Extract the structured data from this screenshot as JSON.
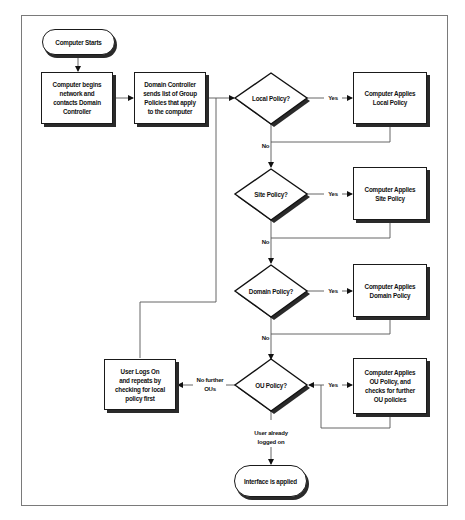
{
  "diagram": {
    "type": "flowchart",
    "nodes": {
      "start": "Computer Starts",
      "begin_network": [
        "Computer begins",
        "network and",
        "contacts Domain",
        "Controller"
      ],
      "dc_sends": [
        "Domain Controller",
        "sends list of Group",
        "Policies that apply",
        "to the computer"
      ],
      "local_q": "Local Policy?",
      "local_apply": [
        "Computer Applies",
        "Local Policy"
      ],
      "site_q": "Site Policy?",
      "site_apply": [
        "Computer Applies",
        "Site Policy"
      ],
      "domain_q": "Domain Policy?",
      "domain_apply": [
        "Computer Applies",
        "Domain Policy"
      ],
      "ou_q": "OU Policy?",
      "ou_apply": [
        "Computer Applies",
        "OU Policy, and",
        "checks for further",
        "OU policies"
      ],
      "user_logs_on": [
        "User Logs On",
        "and repeats by",
        "checking for local",
        "policy first"
      ],
      "end": "Interface is applied"
    },
    "edge_labels": {
      "yes": "Yes",
      "no": "No",
      "no_further": [
        "No further",
        "OUs"
      ],
      "user_logged_on": [
        "User already",
        "logged on"
      ]
    },
    "edges": [
      {
        "from": "start",
        "to": "begin_network"
      },
      {
        "from": "begin_network",
        "to": "dc_sends"
      },
      {
        "from": "dc_sends",
        "to": "local_q"
      },
      {
        "from": "local_q",
        "to": "local_apply",
        "label": "Yes"
      },
      {
        "from": "local_q",
        "to": "site_q",
        "label": "No"
      },
      {
        "from": "local_apply",
        "to": "site_q"
      },
      {
        "from": "site_q",
        "to": "site_apply",
        "label": "Yes"
      },
      {
        "from": "site_q",
        "to": "domain_q",
        "label": "No"
      },
      {
        "from": "site_apply",
        "to": "domain_q"
      },
      {
        "from": "domain_q",
        "to": "domain_apply",
        "label": "Yes"
      },
      {
        "from": "domain_q",
        "to": "ou_q",
        "label": "No"
      },
      {
        "from": "domain_apply",
        "to": "ou_q"
      },
      {
        "from": "ou_q",
        "to": "ou_apply",
        "label": "Yes"
      },
      {
        "from": "ou_apply",
        "to": "ou_q"
      },
      {
        "from": "ou_q",
        "to": "user_logs_on",
        "label": "No further OUs"
      },
      {
        "from": "user_logs_on",
        "to": "local_q"
      },
      {
        "from": "ou_q",
        "to": "end",
        "label": "User already logged on"
      }
    ]
  }
}
